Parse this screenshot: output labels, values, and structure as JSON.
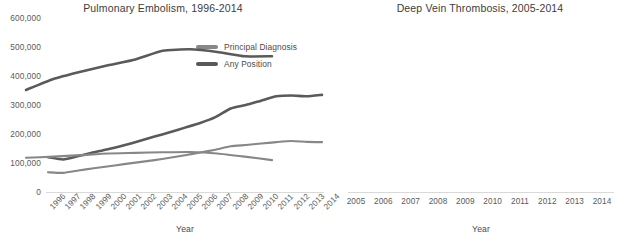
{
  "figure": {
    "axis_title": "Year",
    "y_ticks": [
      "0",
      "100,000",
      "200,000",
      "300,000",
      "400,000",
      "500,000",
      "600,000"
    ],
    "y_tick_values": [
      0,
      100000,
      200000,
      300000,
      400000,
      500000,
      600000
    ],
    "legend": [
      {
        "label": "Principal Diagnosis",
        "color": "#878787"
      },
      {
        "label": "Any Position",
        "color": "#5a5a5a"
      }
    ]
  },
  "chart_data": [
    {
      "type": "line",
      "title": "Pulmonary Embolism, 1996-2014",
      "xlabel": "Year",
      "ylabel": "",
      "ylim": [
        0,
        600000
      ],
      "grid": false,
      "legend_position": "inside-upper-center",
      "categories": [
        "1996",
        "1997",
        "1998",
        "1999",
        "2000",
        "2001",
        "2002",
        "2003",
        "2004",
        "2005",
        "2006",
        "2007",
        "2008",
        "2009",
        "2010",
        "2011",
        "2012",
        "2013",
        "2014"
      ],
      "series": [
        {
          "name": "Principal Diagnosis",
          "color": "#878787",
          "values": [
            68000,
            66000,
            74000,
            82000,
            89000,
            96000,
            103000,
            110000,
            118000,
            127000,
            136000,
            146000,
            158000,
            162000,
            167000,
            172000,
            176000,
            173000,
            172000
          ]
        },
        {
          "name": "Any Position",
          "color": "#5a5a5a",
          "values": [
            120000,
            112000,
            124000,
            137000,
            148000,
            161000,
            176000,
            191000,
            206000,
            222000,
            238000,
            258000,
            288000,
            300000,
            315000,
            330000,
            333000,
            330000,
            335000
          ]
        }
      ]
    },
    {
      "type": "line",
      "title": "Deep Vein Thrombosis, 2005-2014",
      "xlabel": "Year",
      "ylabel": "",
      "ylim": [
        0,
        600000
      ],
      "grid": false,
      "legend_position": "none",
      "categories": [
        "2005",
        "2006",
        "2007",
        "2008",
        "2009",
        "2010",
        "2011",
        "2012",
        "2013",
        "2014"
      ],
      "series": [
        {
          "name": "Principal Diagnosis",
          "color": "#878787",
          "values": [
            118000,
            122000,
            127000,
            133000,
            135000,
            137000,
            138000,
            133000,
            122000,
            110000
          ]
        },
        {
          "name": "Any Position",
          "color": "#5a5a5a",
          "values": [
            352000,
            390000,
            415000,
            437000,
            457000,
            487000,
            492000,
            483000,
            468000,
            468000
          ]
        }
      ]
    }
  ]
}
